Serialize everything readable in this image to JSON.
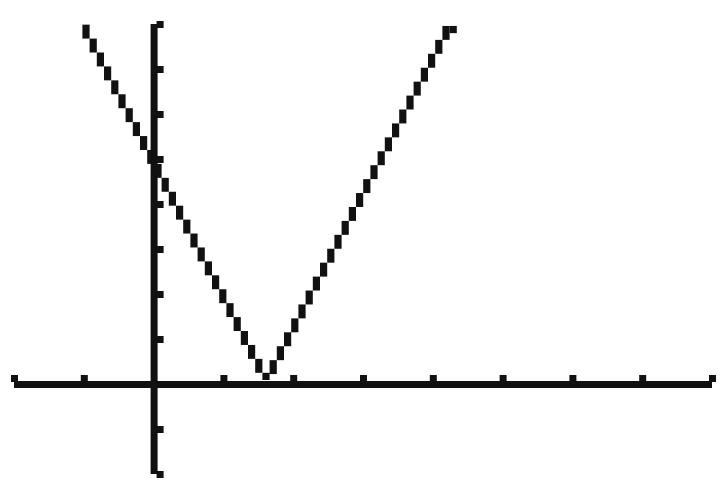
{
  "chart_data": {
    "type": "line",
    "title": "",
    "xlabel": "",
    "ylabel": "",
    "function": "y = |3x - 5|",
    "xlim": [
      -2,
      8
    ],
    "ylim": [
      -2,
      8
    ],
    "xscl": 1,
    "yscl": 1,
    "grid": false,
    "legend": null,
    "x_ticks": [
      -2,
      -1,
      0,
      1,
      2,
      3,
      4,
      5,
      6,
      7,
      8
    ],
    "y_ticks": [
      -2,
      -1,
      0,
      1,
      2,
      3,
      4,
      5,
      6,
      7,
      8
    ],
    "series": [
      {
        "name": "y1",
        "x": [
          -1,
          0,
          1,
          1.667,
          2,
          3,
          4,
          4.333
        ],
        "values": [
          8,
          5,
          2,
          0,
          1,
          4,
          7,
          8
        ]
      }
    ],
    "annotations": [],
    "vertex": [
      1.667,
      0
    ],
    "y_intercept": 5
  },
  "colors": {
    "background": "#ffffff",
    "ink": "#111111"
  }
}
